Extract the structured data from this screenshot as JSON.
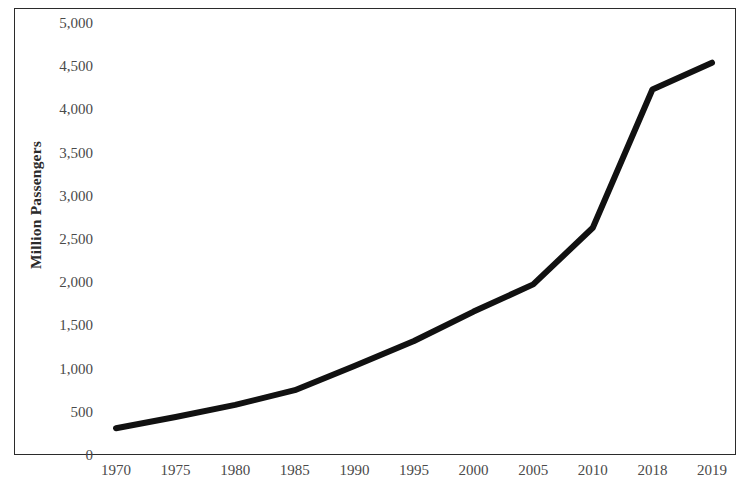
{
  "chart_data": {
    "type": "line",
    "title": "",
    "subtitle": "",
    "xlabel": "",
    "ylabel": "Million Passengers",
    "categories": [
      "1970",
      "1975",
      "1980",
      "1985",
      "1990",
      "1995",
      "2000",
      "2005",
      "2010",
      "2018",
      "2019"
    ],
    "values": [
      310,
      440,
      580,
      750,
      1030,
      1320,
      1660,
      1975,
      2630,
      4230,
      4540
    ],
    "series": [
      {
        "name": "Million Passengers",
        "values": [
          310,
          440,
          580,
          750,
          1030,
          1320,
          1660,
          1975,
          2630,
          4230,
          4540
        ]
      }
    ],
    "ylim": [
      0,
      5000
    ],
    "ytick_step": 500,
    "ytick_labels": [
      "5,000",
      "4,500",
      "4,000",
      "3,500",
      "3,000",
      "2,500",
      "2,000",
      "1,500",
      "1,000",
      "500",
      "0"
    ],
    "ytick_values": [
      5000,
      4500,
      4000,
      3500,
      3000,
      2500,
      2000,
      1500,
      1000,
      500,
      0
    ],
    "grid": false,
    "legend": "none",
    "line_color": "#111111",
    "line_width": 6,
    "frame_color": "#2b2b2b",
    "background_color": "#ffffff"
  }
}
